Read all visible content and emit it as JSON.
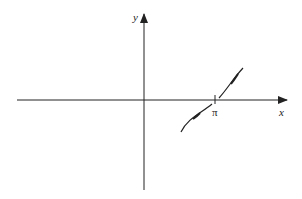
{
  "diagram": {
    "type": "coordinate-plot",
    "axes": {
      "x_label": "x",
      "y_label": "y"
    },
    "tick_labels": [
      {
        "name": "pi",
        "text": "π"
      }
    ],
    "curve": {
      "description": "increasing curve crossing x-axis at pi, with arrows pointing away from pi in both directions",
      "segments": 2
    },
    "colors": {
      "stroke": "#222222",
      "background": "#ffffff"
    }
  }
}
